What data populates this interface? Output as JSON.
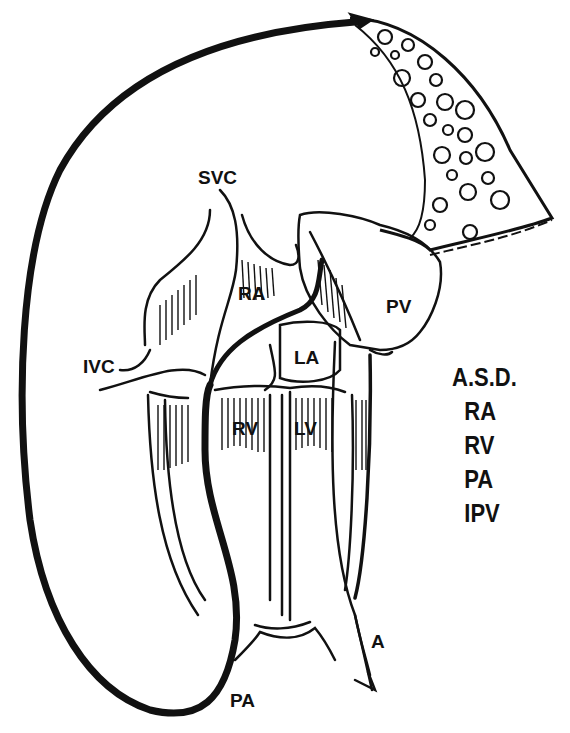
{
  "diagram": {
    "title": "A.S.D.",
    "labels": {
      "svc": "SVC",
      "ivc": "IVC",
      "ra": "RA",
      "la": "LA",
      "rv": "RV",
      "lv": "LV",
      "pv": "PV",
      "pa": "PA",
      "a": "A"
    },
    "legend": {
      "title": "A.S.D.",
      "items": [
        "RA",
        "RV",
        "PA",
        "IPV"
      ]
    },
    "colors": {
      "ink": "#111111",
      "background": "#ffffff"
    }
  }
}
